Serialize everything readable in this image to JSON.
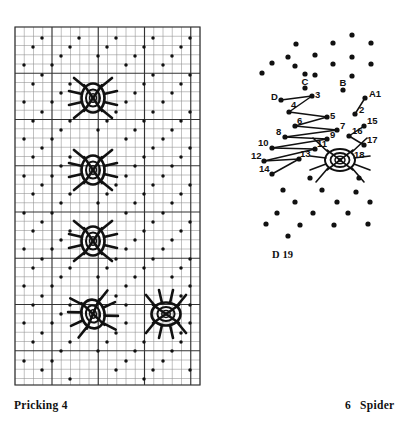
{
  "figure": {
    "kind": "bobbin-lace-pricking-and-working-diagram",
    "ink_color": "#111111",
    "paper_color": "#ffffff"
  },
  "captions": {
    "left": "Pricking 4",
    "right_number": "6",
    "right_label": "Spider",
    "right_full": "6   Spider",
    "diagram_ref_letter": "D",
    "diagram_ref_number": "19",
    "diagram_ref_full": "D 19"
  },
  "pricking": {
    "title": "Pricking 4",
    "grid": {
      "x": 15,
      "y": 27,
      "width": 185,
      "height": 358,
      "cell": 9.25,
      "cols": 20,
      "rows": 38.7,
      "minor_color": "#8e8e8e",
      "minor_width": 0.55,
      "major_color": "#333333",
      "major_width": 1.15,
      "major_every_col": 5,
      "major_every_row": 5,
      "border_color": "#333333",
      "border_width": 1.2
    },
    "dot_lattice": {
      "description": "diagonal half-drop lattice of pinholes",
      "dot_radius": 1.75,
      "dot_color": "#111111",
      "spacing_x": 18.5,
      "spacing_y": 18.5,
      "offset_alternate_rows": 9.25
    },
    "spiders": [
      {
        "id": "spider-1",
        "cx": 93,
        "cy": 98,
        "rx": 11.5,
        "ry": 14.5,
        "legs": 8,
        "rings": 3
      },
      {
        "id": "spider-2",
        "cx": 93,
        "cy": 170,
        "rx": 11.5,
        "ry": 14.5,
        "legs": 8,
        "rings": 3
      },
      {
        "id": "spider-3",
        "cx": 93,
        "cy": 241,
        "rx": 11.5,
        "ry": 14.5,
        "legs": 8,
        "rings": 3
      },
      {
        "id": "spider-4",
        "cx": 93,
        "cy": 314,
        "rx": 11.5,
        "ry": 14.5,
        "legs": 8,
        "rings": 3
      },
      {
        "id": "spider-5",
        "cx": 166,
        "cy": 314,
        "rx": 11.5,
        "ry": 14.5,
        "legs": 8,
        "rings": 3
      }
    ]
  },
  "spider_diagram": {
    "title": "Spider",
    "ref": "D 19",
    "dot_radius": 2.6,
    "dot_color": "#111111",
    "thread_color": "#111111",
    "thread_width": 1.5,
    "pair_labels": [
      {
        "text": "A1",
        "x": 369,
        "y": 97,
        "anchor": "start"
      },
      {
        "text": "B",
        "x": 343,
        "y": 86,
        "anchor": "middle"
      },
      {
        "text": "C",
        "x": 305,
        "y": 85,
        "anchor": "middle"
      },
      {
        "text": "D",
        "x": 271,
        "y": 100,
        "anchor": "start"
      }
    ],
    "pin_labels": [
      {
        "text": "2",
        "x": 359,
        "y": 113,
        "anchor": "start"
      },
      {
        "text": "3",
        "x": 315,
        "y": 98,
        "anchor": "start"
      },
      {
        "text": "4",
        "x": 291,
        "y": 108,
        "anchor": "start"
      },
      {
        "text": "5",
        "x": 330,
        "y": 119,
        "anchor": "start"
      },
      {
        "text": "6",
        "x": 297,
        "y": 124,
        "anchor": "start"
      },
      {
        "text": "7",
        "x": 340,
        "y": 129,
        "anchor": "start"
      },
      {
        "text": "8",
        "x": 286,
        "y": 135,
        "anchor": "start"
      },
      {
        "text": "9",
        "x": 330,
        "y": 138,
        "anchor": "start"
      },
      {
        "text": "10",
        "x": 271,
        "y": 146,
        "anchor": "start"
      },
      {
        "text": "11",
        "x": 317,
        "y": 147,
        "anchor": "start"
      },
      {
        "text": "12",
        "x": 262,
        "y": 159,
        "anchor": "start"
      },
      {
        "text": "13",
        "x": 300,
        "y": 157,
        "anchor": "start"
      },
      {
        "text": "14",
        "x": 265,
        "y": 172,
        "anchor": "start"
      },
      {
        "text": "15",
        "x": 367,
        "y": 124,
        "anchor": "start"
      },
      {
        "text": "16",
        "x": 352,
        "y": 134,
        "anchor": "start"
      },
      {
        "text": "17",
        "x": 367,
        "y": 143,
        "anchor": "start"
      },
      {
        "text": "18",
        "x": 354,
        "y": 158,
        "anchor": "start"
      }
    ],
    "pin_count": 18,
    "pair_count": 4,
    "body": {
      "cx": 340,
      "cy": 160,
      "rx": 15,
      "ry": 11,
      "rings": 3,
      "legs": 8
    }
  }
}
